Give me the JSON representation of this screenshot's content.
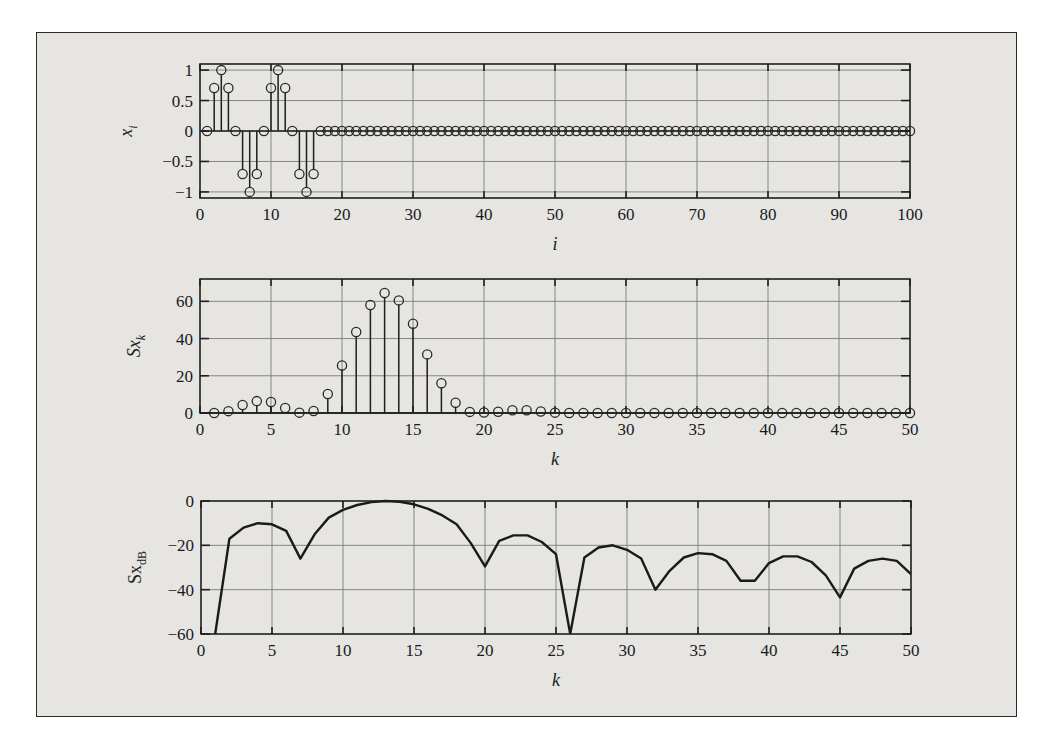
{
  "colors": {
    "page_background": "#ffffff",
    "figure_background": "#e6e5e2",
    "ink": "#1e1e1e",
    "grid": "#7a7a7a"
  },
  "chart_data": [
    {
      "id": "time-signal",
      "type": "stem",
      "title": "",
      "xlabel": "i",
      "ylabel": "x",
      "ylabel_sub": "i",
      "xlim": [
        0,
        100
      ],
      "ylim": [
        -1.1,
        1.1
      ],
      "xticks": [
        0,
        10,
        20,
        30,
        40,
        50,
        60,
        70,
        80,
        90,
        100
      ],
      "xtick_labels": [
        "0",
        "10",
        "20",
        "30",
        "40",
        "50",
        "60",
        "70",
        "80",
        "90",
        "100"
      ],
      "yticks": [
        -1,
        -0.5,
        0,
        0.5,
        1
      ],
      "ytick_labels": [
        "−1",
        "−0.5",
        "0",
        "0.5",
        "1"
      ],
      "grid": true,
      "x": [
        1,
        2,
        3,
        4,
        5,
        6,
        7,
        8,
        9,
        10,
        11,
        12,
        13,
        14,
        15,
        16,
        17,
        18,
        19,
        20,
        21,
        22,
        23,
        24,
        25,
        26,
        27,
        28,
        29,
        30,
        31,
        32,
        33,
        34,
        35,
        36,
        37,
        38,
        39,
        40,
        41,
        42,
        43,
        44,
        45,
        46,
        47,
        48,
        49,
        50,
        51,
        52,
        53,
        54,
        55,
        56,
        57,
        58,
        59,
        60,
        61,
        62,
        63,
        64,
        65,
        66,
        67,
        68,
        69,
        70,
        71,
        72,
        73,
        74,
        75,
        76,
        77,
        78,
        79,
        80,
        81,
        82,
        83,
        84,
        85,
        86,
        87,
        88,
        89,
        90,
        91,
        92,
        93,
        94,
        95,
        96,
        97,
        98,
        99,
        100
      ],
      "values": [
        0,
        0.707,
        1,
        0.707,
        0,
        -0.707,
        -1,
        -0.707,
        0,
        0.707,
        1,
        0.707,
        0,
        -0.707,
        -1,
        -0.707,
        0,
        0,
        0,
        0,
        0,
        0,
        0,
        0,
        0,
        0,
        0,
        0,
        0,
        0,
        0,
        0,
        0,
        0,
        0,
        0,
        0,
        0,
        0,
        0,
        0,
        0,
        0,
        0,
        0,
        0,
        0,
        0,
        0,
        0,
        0,
        0,
        0,
        0,
        0,
        0,
        0,
        0,
        0,
        0,
        0,
        0,
        0,
        0,
        0,
        0,
        0,
        0,
        0,
        0,
        0,
        0,
        0,
        0,
        0,
        0,
        0,
        0,
        0,
        0,
        0,
        0,
        0,
        0,
        0,
        0,
        0,
        0,
        0,
        0,
        0,
        0,
        0,
        0,
        0,
        0,
        0,
        0,
        0,
        0
      ],
      "box_px": {
        "left": 200,
        "top": 64,
        "right": 910,
        "bottom": 198
      }
    },
    {
      "id": "power-spectrum",
      "type": "stem",
      "title": "",
      "xlabel": "k",
      "ylabel": "Sx",
      "ylabel_sub": "k",
      "xlim": [
        0,
        50
      ],
      "ylim": [
        0,
        72
      ],
      "xticks": [
        0,
        5,
        10,
        15,
        20,
        25,
        30,
        35,
        40,
        45,
        50
      ],
      "xtick_labels": [
        "0",
        "5",
        "10",
        "15",
        "20",
        "25",
        "30",
        "35",
        "40",
        "45",
        "50"
      ],
      "yticks": [
        0,
        20,
        40,
        60
      ],
      "ytick_labels": [
        "0",
        "20",
        "40",
        "60"
      ],
      "grid": true,
      "x": [
        1,
        2,
        3,
        4,
        5,
        6,
        7,
        8,
        9,
        10,
        11,
        12,
        13,
        14,
        15,
        16,
        17,
        18,
        19,
        20,
        21,
        22,
        23,
        24,
        25,
        26,
        27,
        28,
        29,
        30,
        31,
        32,
        33,
        34,
        35,
        36,
        37,
        38,
        39,
        40,
        41,
        42,
        43,
        44,
        45,
        46,
        47,
        48,
        49,
        50
      ],
      "values": [
        0,
        1.0,
        4.3,
        6.4,
        5.9,
        2.7,
        0.2,
        1.1,
        10.2,
        25.5,
        43.5,
        58,
        64.5,
        60.5,
        48,
        31.5,
        16,
        5.5,
        0.6,
        0.3,
        0.7,
        1.5,
        1.5,
        0.8,
        0.2,
        0,
        0,
        0,
        0,
        0,
        0,
        0,
        0,
        0,
        0,
        0,
        0,
        0,
        0,
        0,
        0,
        0,
        0,
        0,
        0,
        0,
        0,
        0,
        0,
        0
      ],
      "box_px": {
        "left": 200,
        "top": 279,
        "right": 910,
        "bottom": 413
      }
    },
    {
      "id": "power-spectrum-db",
      "type": "line",
      "title": "",
      "xlabel": "k",
      "ylabel": "Sx",
      "ylabel_sub": "dB",
      "xlim": [
        0,
        50
      ],
      "ylim": [
        -60,
        0
      ],
      "xticks": [
        0,
        5,
        10,
        15,
        20,
        25,
        30,
        35,
        40,
        45,
        50
      ],
      "xtick_labels": [
        "0",
        "5",
        "10",
        "15",
        "20",
        "25",
        "30",
        "35",
        "40",
        "45",
        "50"
      ],
      "yticks": [
        -60,
        -40,
        -20,
        0
      ],
      "ytick_labels": [
        "−60",
        "−40",
        "−20",
        "0"
      ],
      "grid": true,
      "x": [
        1,
        2,
        3,
        4,
        5,
        6,
        7,
        8,
        9,
        10,
        11,
        12,
        13,
        14,
        15,
        16,
        17,
        18,
        19,
        20,
        21,
        22,
        23,
        24,
        25,
        26,
        27,
        28,
        29,
        30,
        31,
        32,
        33,
        34,
        35,
        36,
        37,
        38,
        39,
        40,
        41,
        42,
        43,
        44,
        45,
        46,
        47,
        48,
        49,
        50
      ],
      "values": [
        -2000,
        -17,
        -12,
        -10,
        -10.5,
        -13.5,
        -26,
        -15,
        -7.5,
        -4,
        -1.8,
        -0.5,
        0,
        -0.3,
        -1.5,
        -3.5,
        -6.5,
        -10.5,
        -19,
        -29.5,
        -18,
        -15.5,
        -15.5,
        -18.5,
        -24,
        -2000,
        -25.5,
        -21,
        -20,
        -22,
        -26,
        -40,
        -31.5,
        -25.5,
        -23.5,
        -24,
        -27,
        -36,
        -36,
        -28,
        -25,
        -25,
        -27.5,
        -33.5,
        -43.5,
        -30.5,
        -27,
        -26,
        -27,
        -33
      ],
      "note": "-2000 denotes -inf (zero power), clipped at plot bottom",
      "box_px": {
        "left": 201,
        "top": 501,
        "right": 911,
        "bottom": 634
      }
    }
  ]
}
